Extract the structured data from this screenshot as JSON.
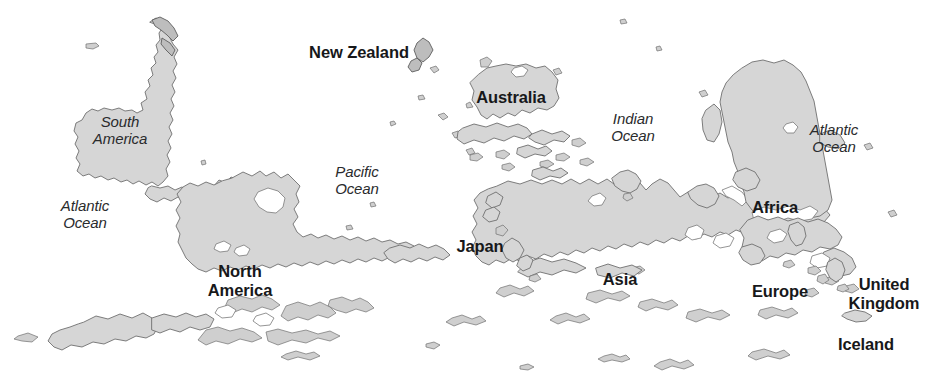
{
  "map": {
    "kind": "world-map",
    "orientation": "south-up (inverted) world map",
    "projection_note": "Upside-down world map; continents rotated 180 degrees",
    "colors": {
      "land_fill": "#d6d6d6",
      "land_stroke": "#6f6f6f",
      "ocean_fill": "#ffffff",
      "label_color": "#17181a"
    },
    "labels": {
      "south_america": "South\nAmerica",
      "north_america": "North\nAmerica",
      "new_zealand": "New Zealand",
      "australia": "Australia",
      "japan": "Japan",
      "asia": "Asia",
      "africa": "Africa",
      "europe": "Europe",
      "united_kingdom": "United\nKingdom",
      "iceland": "Iceland",
      "pacific_ocean": "Pacific\nOcean",
      "indian_ocean": "Indian\nOcean",
      "atlantic_ocean_west": "Atlantic\nOcean",
      "atlantic_ocean_east": "Atlantic\nOcean"
    },
    "label_list": [
      {
        "name": "south-america",
        "text": "South\nAmerica",
        "style": "italic",
        "x": 120,
        "y": 113
      },
      {
        "name": "new-zealand",
        "text": "New Zealand",
        "style": "bold",
        "x": 359,
        "y": 43
      },
      {
        "name": "australia",
        "text": "Australia",
        "style": "bold",
        "x": 511,
        "y": 88
      },
      {
        "name": "indian-ocean",
        "text": "Indian\nOcean",
        "style": "italic",
        "x": 633,
        "y": 110
      },
      {
        "name": "atlantic-ocean-east",
        "text": "Atlantic\nOcean",
        "style": "italic",
        "x": 834,
        "y": 121
      },
      {
        "name": "pacific-ocean",
        "text": "Pacific\nOcean",
        "style": "italic",
        "x": 357,
        "y": 163
      },
      {
        "name": "africa",
        "text": "Africa",
        "style": "bold",
        "x": 775,
        "y": 198
      },
      {
        "name": "atlantic-ocean-west",
        "text": "Atlantic\nOcean",
        "style": "italic",
        "x": 85,
        "y": 197
      },
      {
        "name": "japan",
        "text": "Japan",
        "style": "bold",
        "x": 480,
        "y": 237
      },
      {
        "name": "asia",
        "text": "Asia",
        "style": "bold",
        "x": 620,
        "y": 270
      },
      {
        "name": "north-america",
        "text": "North\nAmerica",
        "style": "bold",
        "x": 240,
        "y": 262
      },
      {
        "name": "europe",
        "text": "Europe",
        "style": "bold",
        "x": 780,
        "y": 282
      },
      {
        "name": "united-kingdom",
        "text": "United\nKingdom",
        "style": "bold",
        "x": 884,
        "y": 275
      },
      {
        "name": "iceland",
        "text": "Iceland",
        "style": "bold",
        "x": 866,
        "y": 335
      }
    ]
  }
}
